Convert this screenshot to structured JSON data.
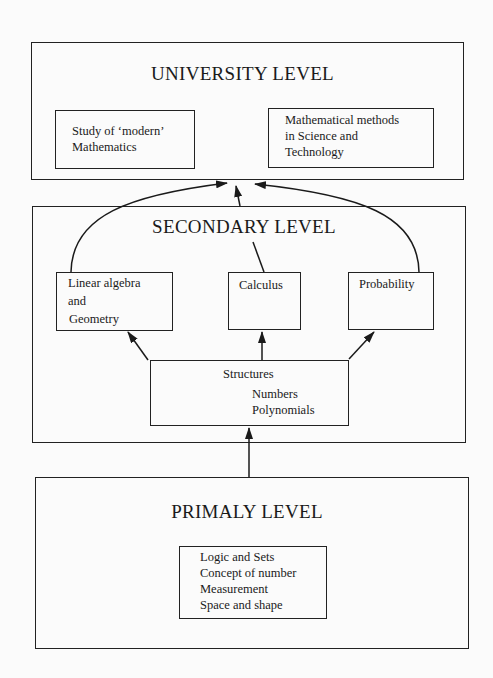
{
  "levels": {
    "university": {
      "title": "UNIVERSITY LEVEL",
      "boxes": [
        {
          "lines": [
            "Study of ‘modern’",
            "Mathematics"
          ]
        },
        {
          "lines": [
            "Mathematical methods",
            "in Science and",
            "Technology"
          ]
        }
      ]
    },
    "secondary": {
      "title": "SECONDARY LEVEL",
      "boxes": [
        {
          "lines": [
            "Linear algebra",
            "and",
            "Geometry"
          ]
        },
        {
          "lines": [
            "Calculus"
          ]
        },
        {
          "lines": [
            "Probability"
          ]
        }
      ],
      "structures": {
        "title": "Structures",
        "items": [
          "Numbers",
          "Polynomials"
        ]
      }
    },
    "primary": {
      "title": "PRIMALY LEVEL",
      "items": [
        "Logic and Sets",
        "Concept of number",
        "Measurement",
        "Space and shape"
      ]
    }
  },
  "edges": [
    {
      "from": "Primary level",
      "to": "Structures"
    },
    {
      "from": "Structures",
      "to": "Linear algebra and Geometry"
    },
    {
      "from": "Structures",
      "to": "Calculus"
    },
    {
      "from": "Structures",
      "to": "Probability"
    },
    {
      "from": "Linear algebra and Geometry",
      "to": "University level"
    },
    {
      "from": "Calculus",
      "to": "University level"
    },
    {
      "from": "Probability",
      "to": "University level"
    }
  ]
}
